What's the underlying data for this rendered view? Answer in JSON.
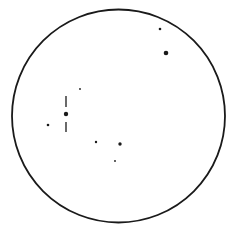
{
  "finder_chart": {
    "field_circle": {
      "cx": 118.5,
      "cy": 116,
      "r": 106.5,
      "stroke": "#1a1a1a",
      "stroke_width": 1.8
    },
    "target": {
      "x": 66,
      "y": 114,
      "r": 2.2,
      "ticks": [
        {
          "x": 66,
          "y1": 96,
          "y2": 107
        },
        {
          "x": 66,
          "y1": 122,
          "y2": 132
        }
      ]
    },
    "stars": [
      {
        "x": 160,
        "y": 29,
        "r": 1.3
      },
      {
        "x": 166,
        "y": 53,
        "r": 2.3
      },
      {
        "x": 80,
        "y": 89,
        "r": 0.9
      },
      {
        "x": 48,
        "y": 125,
        "r": 1.3
      },
      {
        "x": 96,
        "y": 142,
        "r": 1.2
      },
      {
        "x": 120,
        "y": 144,
        "r": 1.7
      },
      {
        "x": 115,
        "y": 161,
        "r": 0.9
      }
    ],
    "ink_color": "#1a1a1a"
  }
}
